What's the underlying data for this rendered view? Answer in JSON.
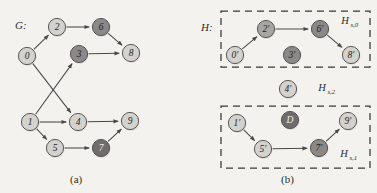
{
  "figure": {
    "panel_a_caption": "(a)",
    "panel_b_caption": "(b)",
    "graph_g_label": "G:",
    "graph_h_label": "H:"
  },
  "palette": {
    "background": "#f3f2ef",
    "node_light": "#d4d2cf",
    "node_medium": "#a8a6a3",
    "node_dark": "#8b8987",
    "node_darkest": "#6f6d6b",
    "stroke": "#4a4846",
    "edge": "#4a4846",
    "text": "#2b2b2b",
    "dashed_box": "#3a3836"
  },
  "graph_g": {
    "name": "G",
    "nodes": [
      {
        "id": "0",
        "label": "0",
        "x": 27,
        "y": 56,
        "shade": "light"
      },
      {
        "id": "1",
        "label": "1",
        "x": 30,
        "y": 122,
        "shade": "light"
      },
      {
        "id": "2",
        "label": "2",
        "x": 57,
        "y": 27,
        "shade": "light"
      },
      {
        "id": "3",
        "label": "3",
        "x": 79,
        "y": 54,
        "shade": "dark"
      },
      {
        "id": "4",
        "label": "4",
        "x": 78,
        "y": 122,
        "shade": "light"
      },
      {
        "id": "5",
        "label": "5",
        "x": 55,
        "y": 148,
        "shade": "light"
      },
      {
        "id": "6",
        "label": "6",
        "x": 101,
        "y": 27,
        "shade": "dark"
      },
      {
        "id": "7",
        "label": "7",
        "x": 101,
        "y": 148,
        "shade": "darkest"
      },
      {
        "id": "8",
        "label": "8",
        "x": 131,
        "y": 53,
        "shade": "light"
      },
      {
        "id": "9",
        "label": "9",
        "x": 130,
        "y": 121,
        "shade": "light"
      }
    ],
    "edges": [
      {
        "from": "0",
        "to": "2"
      },
      {
        "from": "0",
        "to": "4"
      },
      {
        "from": "1",
        "to": "3"
      },
      {
        "from": "1",
        "to": "4"
      },
      {
        "from": "1",
        "to": "5"
      },
      {
        "from": "2",
        "to": "6"
      },
      {
        "from": "3",
        "to": "8"
      },
      {
        "from": "4",
        "to": "9"
      },
      {
        "from": "5",
        "to": "7"
      },
      {
        "from": "6",
        "to": "8"
      },
      {
        "from": "7",
        "to": "9"
      }
    ]
  },
  "graph_h": {
    "name": "H",
    "nodes": [
      {
        "id": "0p",
        "label": "0′",
        "x": 235,
        "y": 55,
        "shade": "light"
      },
      {
        "id": "2p",
        "label": "2′",
        "x": 266,
        "y": 29,
        "shade": "medium"
      },
      {
        "id": "3p",
        "label": "3′",
        "x": 292,
        "y": 55,
        "shade": "dark"
      },
      {
        "id": "6p",
        "label": "6′",
        "x": 320,
        "y": 29,
        "shade": "dark"
      },
      {
        "id": "8p",
        "label": "8′",
        "x": 351,
        "y": 55,
        "shade": "light"
      },
      {
        "id": "4p",
        "label": "4′",
        "x": 288,
        "y": 89,
        "shade": "light"
      },
      {
        "id": "1p",
        "label": "1′",
        "x": 237,
        "y": 123,
        "shade": "light"
      },
      {
        "id": "Dp",
        "label": "D",
        "x": 290,
        "y": 120,
        "shade": "darkest"
      },
      {
        "id": "9p",
        "label": "9′",
        "x": 348,
        "y": 121,
        "shade": "light"
      },
      {
        "id": "5p",
        "label": "5′",
        "x": 263,
        "y": 149,
        "shade": "light"
      },
      {
        "id": "7p",
        "label": "7′",
        "x": 319,
        "y": 148,
        "shade": "dark"
      }
    ],
    "edges": [
      {
        "from": "0p",
        "to": "2p"
      },
      {
        "from": "2p",
        "to": "6p"
      },
      {
        "from": "6p",
        "to": "8p"
      },
      {
        "from": "1p",
        "to": "5p"
      },
      {
        "from": "5p",
        "to": "7p"
      },
      {
        "from": "7p",
        "to": "9p"
      }
    ],
    "subgraphs": [
      {
        "id": "hs0",
        "label_base": "H",
        "label_sub": "s,0",
        "label_x": 345,
        "label_y": 24,
        "box": {
          "x": 221,
          "y": 11,
          "w": 149,
          "h": 56
        }
      },
      {
        "id": "hs2",
        "label_base": "H",
        "label_sub": "s,2",
        "label_x": 322,
        "label_y": 91,
        "box": null
      },
      {
        "id": "hs1",
        "label_base": "H",
        "label_sub": "s,1",
        "label_x": 344,
        "label_y": 157,
        "box": {
          "x": 221,
          "y": 106,
          "w": 149,
          "h": 62
        }
      }
    ]
  }
}
